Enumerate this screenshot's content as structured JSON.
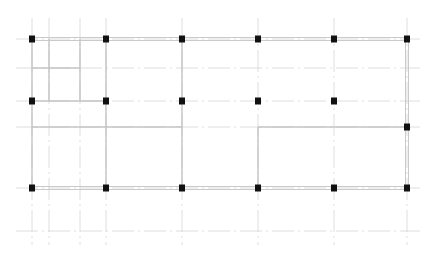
{
  "diagram": {
    "type": "structural-floor-plan",
    "width": 435,
    "height": 261,
    "colors": {
      "background": "#ffffff",
      "grid_line": "#d6d6d6",
      "wall_line": "#c4c4c4",
      "column": "#111111"
    },
    "grid_axes": {
      "vertical_x": [
        32,
        49,
        80,
        106,
        182,
        258,
        334,
        407
      ],
      "horizontal_y": [
        39,
        68,
        101,
        127,
        188,
        231
      ]
    },
    "columns": [
      {
        "x": 32,
        "y": 39
      },
      {
        "x": 106,
        "y": 39
      },
      {
        "x": 182,
        "y": 39
      },
      {
        "x": 258,
        "y": 39
      },
      {
        "x": 334,
        "y": 39
      },
      {
        "x": 407,
        "y": 39
      },
      {
        "x": 32,
        "y": 101
      },
      {
        "x": 106,
        "y": 101
      },
      {
        "x": 182,
        "y": 101
      },
      {
        "x": 258,
        "y": 101
      },
      {
        "x": 334,
        "y": 101
      },
      {
        "x": 407,
        "y": 127
      },
      {
        "x": 32,
        "y": 188
      },
      {
        "x": 106,
        "y": 188
      },
      {
        "x": 182,
        "y": 188
      },
      {
        "x": 258,
        "y": 188
      },
      {
        "x": 334,
        "y": 188
      },
      {
        "x": 407,
        "y": 188
      }
    ],
    "walls": [
      {
        "x1": 32,
        "y1": 39,
        "x2": 407,
        "y2": 39,
        "double": true
      },
      {
        "x1": 32,
        "y1": 188,
        "x2": 407,
        "y2": 188,
        "double": true
      },
      {
        "x1": 32,
        "y1": 101,
        "x2": 106,
        "y2": 101,
        "double": false
      },
      {
        "x1": 32,
        "y1": 127,
        "x2": 182,
        "y2": 127,
        "double": false
      },
      {
        "x1": 258,
        "y1": 127,
        "x2": 407,
        "y2": 127,
        "double": false
      },
      {
        "x1": 32,
        "y1": 68,
        "x2": 80,
        "y2": 68,
        "double": false
      },
      {
        "x1": 49,
        "y1": 39,
        "x2": 49,
        "y2": 101,
        "double": false
      },
      {
        "x1": 80,
        "y1": 39,
        "x2": 80,
        "y2": 101,
        "double": false
      },
      {
        "x1": 32,
        "y1": 39,
        "x2": 32,
        "y2": 188,
        "double": false
      },
      {
        "x1": 106,
        "y1": 39,
        "x2": 106,
        "y2": 188,
        "double": false
      },
      {
        "x1": 182,
        "y1": 39,
        "x2": 182,
        "y2": 188,
        "double": false
      },
      {
        "x1": 258,
        "y1": 127,
        "x2": 258,
        "y2": 188,
        "double": false
      },
      {
        "x1": 407,
        "y1": 39,
        "x2": 407,
        "y2": 188,
        "double": true
      }
    ]
  }
}
